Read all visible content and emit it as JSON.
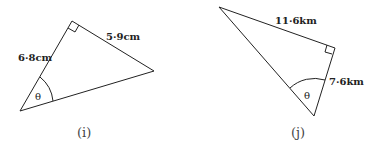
{
  "diagrams": [
    {
      "id": "i",
      "caption": "(i)",
      "sides": {
        "hypotenuse_adjacent_label": "6·8cm",
        "opposite_label": "5·9cm"
      },
      "angle_label": "θ",
      "right_angle": true
    },
    {
      "id": "j",
      "caption": "(j)",
      "sides": {
        "opposite_label": "11·6km",
        "adjacent_label": "7·6km"
      },
      "angle_label": "θ",
      "right_angle": true
    }
  ]
}
